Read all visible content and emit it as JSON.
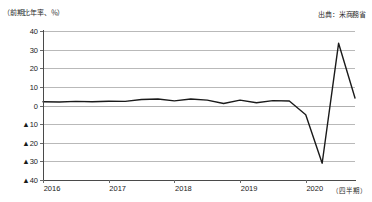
{
  "header": {
    "unit_label": "（前期比年率、％）",
    "source_label": "出典：米商務省"
  },
  "axis": {
    "x_unit_label": "（四半期）",
    "y_ticks": [
      "40",
      "30",
      "20",
      "10",
      "0",
      "▲10",
      "▲20",
      "▲30",
      "▲40"
    ],
    "x_ticks": [
      "2016",
      "2017",
      "2018",
      "2019",
      "2020"
    ]
  },
  "chart_data": {
    "type": "line",
    "title": "",
    "subtitle": "",
    "xlabel": "（四半期）",
    "ylabel": "（前期比年率、％）",
    "ylim": [
      -40,
      40
    ],
    "ytick_values": [
      40,
      30,
      20,
      10,
      0,
      -10,
      -20,
      -30,
      -40
    ],
    "ytick_labels": [
      "40",
      "30",
      "20",
      "10",
      "0",
      "▲10",
      "▲20",
      "▲30",
      "▲40"
    ],
    "grid": true,
    "legend": null,
    "annotations": [],
    "source": "出典：米商務省",
    "x_category_labels": [
      "2016",
      "2017",
      "2018",
      "2019",
      "2020"
    ],
    "x": [
      "2016Q1",
      "2016Q2",
      "2016Q3",
      "2016Q4",
      "2017Q1",
      "2017Q2",
      "2017Q3",
      "2017Q4",
      "2018Q1",
      "2018Q2",
      "2018Q3",
      "2018Q4",
      "2019Q1",
      "2019Q2",
      "2019Q3",
      "2019Q4",
      "2020Q1",
      "2020Q2",
      "2020Q3",
      "2020Q4"
    ],
    "series": [
      {
        "name": "米国実質GDP成長率",
        "color": "#1a1a1a",
        "values": [
          2.0,
          1.9,
          2.2,
          2.0,
          2.3,
          2.2,
          3.2,
          3.5,
          2.5,
          3.5,
          2.9,
          1.1,
          2.9,
          1.5,
          2.6,
          2.4,
          -5.0,
          -31.0,
          33.4,
          4.0
        ]
      }
    ]
  }
}
